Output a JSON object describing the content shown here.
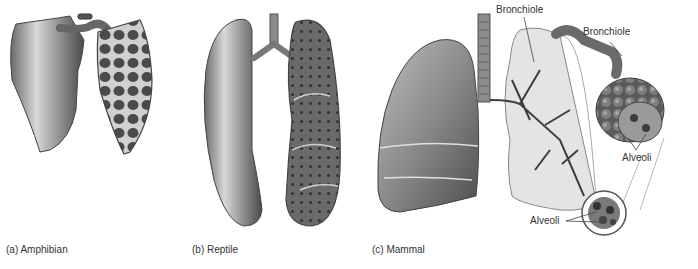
{
  "figure": {
    "panels": [
      {
        "id": "a",
        "caption": "(a) Amphibian"
      },
      {
        "id": "b",
        "caption": "(b) Reptile"
      },
      {
        "id": "c",
        "caption": "(c) Mammal"
      }
    ],
    "labels": {
      "bronchiole_lung": "Bronchiole",
      "bronchiole_cluster": "Bronchiole",
      "alveoli_cluster": "Alveoli",
      "alveoli_inset": "Alveoli"
    }
  },
  "colors": {
    "background": "#ffffff",
    "lung_light": "#c8c8c8",
    "lung_mid": "#8e8e8e",
    "lung_dark": "#555555",
    "cavity_dark": "#3e3e3e",
    "translucent_lung": "#e4e4e4",
    "text": "#333333"
  }
}
